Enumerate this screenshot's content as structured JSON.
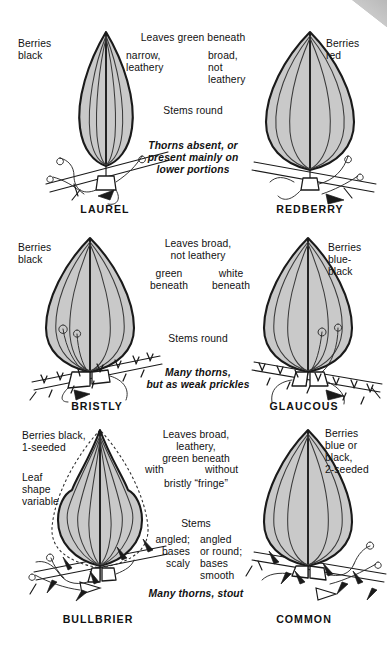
{
  "figure": {
    "type": "identification-key-plate",
    "leaf_fill_color": "#c9c9c9",
    "outline_color": "#1a1a1a",
    "text_color": "#111111"
  },
  "rows": [
    {
      "id": "row-1",
      "shared_heading": "Leaves green beneath",
      "shared_stems": "Stems round",
      "shared_thorn_note": "Thorns absent, or\npresent mainly on\nlower portions",
      "left": {
        "name": "LAUREL",
        "berries": "Berries\nblack",
        "leaf_trait": "narrow,\nleathery",
        "leaf_shape": "narrow-elliptic"
      },
      "right": {
        "name": "REDBERRY",
        "berries": "Berries\nred",
        "leaf_trait": "broad,\nnot\nleathery",
        "leaf_shape": "broad-ovate"
      }
    },
    {
      "id": "row-2",
      "shared_heading": "Leaves broad,\nnot leathery",
      "shared_stems": "Stems round",
      "shared_thorn_note": "Many thorns,\nbut as weak prickles",
      "left": {
        "name": "BRISTLY",
        "berries": "Berries\nblack",
        "leaf_trait": "green\nbeneath",
        "leaf_shape": "broad-ovate"
      },
      "right": {
        "name": "GLAUCOUS",
        "berries": "Berries\nblue-\nblack",
        "leaf_trait": "white\nbeneath",
        "leaf_shape": "broad-ovate"
      }
    },
    {
      "id": "row-3",
      "shared_heading": "Leaves broad,\nleathery,\ngreen beneath",
      "shared_stems": "Stems",
      "shared_thorn_note": "Many thorns, stout",
      "left": {
        "name": "BULLBRIER",
        "berries": "Berries black,\n1-seeded",
        "leaf_trait": "with",
        "leaf_trait2": "bristly “fringe”",
        "stem_trait": "angled;\nbases\nscaly",
        "extra_note": "Leaf\nshape\nvariable",
        "leaf_shape": "fiddle-variable"
      },
      "right": {
        "name": "COMMON",
        "berries": "Berries\nblue or\nblack,\n2-seeded",
        "leaf_trait": "without",
        "stem_trait": "angled\nor round;\nbases\nsmooth",
        "leaf_shape": "broad-ovate"
      }
    }
  ],
  "labels": {
    "row1_heading": "Leaves green beneath",
    "row1_left_trait": "narrow,\nleathery",
    "row1_right_trait": "broad,\nnot\nleathery",
    "row1_stems": "Stems round",
    "row1_thorns": "Thorns absent, or\npresent mainly on\nlower portions",
    "row1_left_berries": "Berries\nblack",
    "row1_right_berries": "Berries\nred",
    "row1_left_name": "LAUREL",
    "row1_right_name": "REDBERRY",
    "row2_heading": "Leaves broad,\nnot leathery",
    "row2_left_trait": "green\nbeneath",
    "row2_right_trait": "white\nbeneath",
    "row2_stems": "Stems round",
    "row2_thorns": "Many thorns,\nbut as weak prickles",
    "row2_left_berries": "Berries\nblack",
    "row2_right_berries": "Berries\nblue-\nblack",
    "row2_left_name": "BRISTLY",
    "row2_right_name": "GLAUCOUS",
    "row3_heading": "Leaves broad,\nleathery,\ngreen beneath",
    "row3_left_trait": "with",
    "row3_right_trait": "without",
    "row3_fringe": "bristly “fringe”",
    "row3_stems": "Stems",
    "row3_left_stem": "angled;\nbases\nscaly",
    "row3_right_stem": "angled\nor round;\nbases\nsmooth",
    "row3_thorns": "Many thorns, stout",
    "row3_left_berries": "Berries black,\n1-seeded",
    "row3_right_berries": "Berries\nblue or\nblack,\n2-seeded",
    "row3_leaf_variable": "Leaf\nshape\nvariable",
    "row3_left_name": "BULLBRIER",
    "row3_right_name": "COMMON"
  }
}
